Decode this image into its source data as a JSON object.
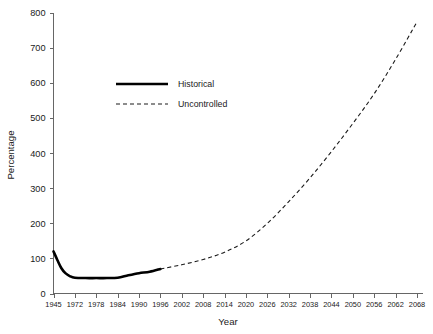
{
  "chart_data": {
    "type": "line",
    "title": "",
    "xlabel": "Year",
    "ylabel": "Percentage",
    "grid": false,
    "legend_position": "upper-left-inside",
    "xlim": [
      1945,
      2068
    ],
    "ylim": [
      0,
      800
    ],
    "ytick_labels": [
      "0",
      "100",
      "200",
      "300",
      "400",
      "500",
      "600",
      "700",
      "800"
    ],
    "ytick_values": [
      0,
      100,
      200,
      300,
      400,
      500,
      600,
      700,
      800
    ],
    "xtick_labels": [
      "1945",
      "1972",
      "1978",
      "1984",
      "1990",
      "1996",
      "2002",
      "2008",
      "2014",
      "2020",
      "2026",
      "2032",
      "2038",
      "2044",
      "2050",
      "2056",
      "2062",
      "2068"
    ],
    "series": [
      {
        "name": "Historical",
        "style": "solid",
        "color": "#000000",
        "x": [
          1945,
          1950,
          1955,
          1960,
          1966,
          1972,
          1975,
          1978,
          1981,
          1984,
          1987,
          1990,
          1993,
          1996
        ],
        "values": [
          120,
          95,
          72,
          58,
          49,
          45,
          44,
          44,
          44,
          45,
          52,
          58,
          62,
          70
        ]
      },
      {
        "name": "Uncontrolled",
        "style": "dashed",
        "color": "#1a1a1a",
        "x": [
          1996,
          2002,
          2008,
          2014,
          2020,
          2026,
          2032,
          2038,
          2044,
          2050,
          2056,
          2062,
          2068
        ],
        "values": [
          70,
          82,
          97,
          118,
          150,
          200,
          262,
          330,
          405,
          485,
          570,
          668,
          775
        ]
      }
    ],
    "annotations": []
  },
  "legend": {
    "entries": [
      {
        "label": "Historical",
        "style": "solid"
      },
      {
        "label": "Uncontrolled",
        "style": "dashed"
      }
    ]
  },
  "axes": {
    "y_title": "Percentage",
    "x_title": "Year"
  }
}
